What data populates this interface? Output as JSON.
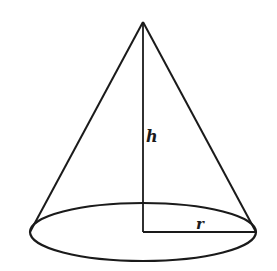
{
  "diagram": {
    "labels": {
      "height": "h",
      "radius": "r"
    },
    "colors": {
      "stroke": "#1a1a1a",
      "background": "#ffffff"
    },
    "geometry": {
      "apex": [
        143,
        22
      ],
      "base_center": [
        143,
        232
      ],
      "base_rx": 113,
      "base_ry": 29,
      "radius_end": [
        256,
        232
      ],
      "tangent_left": [
        30,
        232
      ],
      "tangent_right": [
        256,
        232
      ]
    }
  }
}
